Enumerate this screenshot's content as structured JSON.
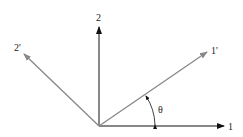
{
  "diagram": {
    "type": "coordinate-rotation",
    "axes": [
      {
        "id": "1",
        "label": "1",
        "color": "#111111"
      },
      {
        "id": "2",
        "label": "2",
        "color": "#111111"
      },
      {
        "id": "1p",
        "label": "1'",
        "color": "#888888"
      },
      {
        "id": "2p",
        "label": "2'",
        "color": "#888888"
      }
    ],
    "angle_label": "θ"
  }
}
